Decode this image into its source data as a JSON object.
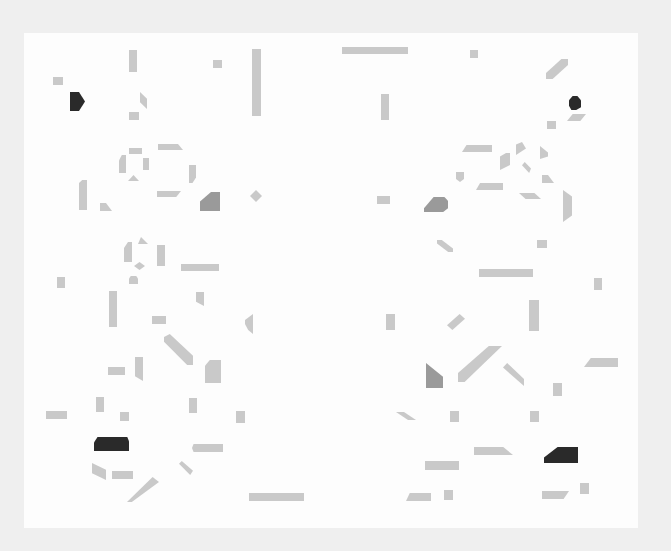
{
  "artwork": {
    "description": "Abstract composition of scattered grey and black geometric fragments on white paper",
    "colors": {
      "light": "#c9c9c9",
      "mid": "#9a9a9a",
      "dark": "#2a2a2a",
      "paper": "#fdfdfd",
      "background": "#efefef"
    },
    "signature": "",
    "shapes": [
      {
        "x": 129,
        "y": 50,
        "w": 8,
        "h": 22,
        "c": "light"
      },
      {
        "x": 213,
        "y": 60,
        "w": 9,
        "h": 8,
        "c": "light"
      },
      {
        "x": 252,
        "y": 49,
        "w": 9,
        "h": 67,
        "c": "light"
      },
      {
        "x": 342,
        "y": 47,
        "w": 66,
        "h": 7,
        "c": "light"
      },
      {
        "x": 470,
        "y": 50,
        "w": 8,
        "h": 8,
        "c": "light"
      },
      {
        "x": 53,
        "y": 77,
        "w": 10,
        "h": 8,
        "c": "light"
      },
      {
        "x": 70,
        "y": 92,
        "w": 15,
        "h": 19,
        "c": "dark",
        "clip": "polygon(0 0,60% 0,100% 50%,60% 100%,0 100%)"
      },
      {
        "x": 140,
        "y": 92,
        "w": 7,
        "h": 17,
        "c": "light",
        "clip": "polygon(0 0,100% 40%,100% 100%,0 60%)"
      },
      {
        "x": 129,
        "y": 112,
        "w": 10,
        "h": 8,
        "c": "light"
      },
      {
        "x": 381,
        "y": 94,
        "w": 8,
        "h": 26,
        "c": "light"
      },
      {
        "x": 546,
        "y": 59,
        "w": 22,
        "h": 20,
        "c": "light",
        "clip": "polygon(70% 0,100% 0,100% 30%,30% 100%,0 100%,0 70%)"
      },
      {
        "x": 569,
        "y": 96,
        "w": 12,
        "h": 14,
        "c": "dark",
        "clip": "polygon(30% 0,70% 0,100% 30%,100% 80%,60% 100%,20% 100%,0 70%,0 30%)"
      },
      {
        "x": 567,
        "y": 114,
        "w": 19,
        "h": 7,
        "c": "light",
        "clip": "polygon(30% 0,100% 0,70% 100%,0 100%)"
      },
      {
        "x": 547,
        "y": 121,
        "w": 9,
        "h": 8,
        "c": "light"
      },
      {
        "x": 129,
        "y": 148,
        "w": 13,
        "h": 6,
        "c": "light"
      },
      {
        "x": 158,
        "y": 144,
        "w": 25,
        "h": 6,
        "c": "light",
        "clip": "polygon(0 0,80% 0,100% 100%,0 100%)"
      },
      {
        "x": 119,
        "y": 155,
        "w": 7,
        "h": 18,
        "c": "light",
        "clip": "polygon(40% 0,100% 0,100% 100%,0 100%,0 30%)"
      },
      {
        "x": 143,
        "y": 158,
        "w": 6,
        "h": 12,
        "c": "light"
      },
      {
        "x": 128,
        "y": 175,
        "w": 11,
        "h": 6,
        "c": "light",
        "clip": "polygon(50% 0,100% 100%,0 100%)"
      },
      {
        "x": 189,
        "y": 165,
        "w": 7,
        "h": 18,
        "c": "light",
        "clip": "polygon(0 0,100% 0,100% 70%,50% 100%,0 100%)"
      },
      {
        "x": 157,
        "y": 191,
        "w": 24,
        "h": 6,
        "c": "light",
        "clip": "polygon(0 0,100% 0,80% 100%,0 100%)"
      },
      {
        "x": 79,
        "y": 180,
        "w": 8,
        "h": 30,
        "c": "light",
        "clip": "polygon(40% 0,100% 0,100% 100%,0 100%,0 10%)"
      },
      {
        "x": 100,
        "y": 203,
        "w": 12,
        "h": 8,
        "c": "light",
        "clip": "polygon(0 0,50% 0,100% 100%,0 100%)"
      },
      {
        "x": 200,
        "y": 192,
        "w": 20,
        "h": 19,
        "c": "mid",
        "clip": "polygon(55% 0,100% 0,100% 100%,0 100%,0 50%)"
      },
      {
        "x": 250,
        "y": 190,
        "w": 12,
        "h": 12,
        "c": "light",
        "clip": "polygon(50% 0,100% 50%,50% 100%,0 50%)"
      },
      {
        "x": 462,
        "y": 145,
        "w": 30,
        "h": 7,
        "c": "light",
        "clip": "polygon(15% 0,100% 0,100% 100%,0 100%)"
      },
      {
        "x": 500,
        "y": 153,
        "w": 10,
        "h": 17,
        "c": "light",
        "clip": "polygon(60% 0,100% 0,100% 70%,0 100%,0 20%)"
      },
      {
        "x": 516,
        "y": 142,
        "w": 10,
        "h": 13,
        "c": "light",
        "clip": "polygon(0 20%,60% 0,100% 50%,0 100%)"
      },
      {
        "x": 540,
        "y": 146,
        "w": 8,
        "h": 13,
        "c": "light",
        "clip": "polygon(0 0,100% 50%,100% 80%,0 100%)"
      },
      {
        "x": 522,
        "y": 162,
        "w": 9,
        "h": 11,
        "c": "light",
        "clip": "polygon(30% 0,100% 60%,80% 100%,0 30%)"
      },
      {
        "x": 456,
        "y": 172,
        "w": 8,
        "h": 10,
        "c": "light",
        "clip": "polygon(0 0,100% 0,100% 70%,50% 100%,0 70%)"
      },
      {
        "x": 476,
        "y": 183,
        "w": 27,
        "h": 7,
        "c": "light",
        "clip": "polygon(15% 0,100% 0,100% 100%,0 100%)"
      },
      {
        "x": 542,
        "y": 175,
        "w": 12,
        "h": 8,
        "c": "light",
        "clip": "polygon(0 0,50% 0,100% 100%,0 100%)"
      },
      {
        "x": 519,
        "y": 193,
        "w": 22,
        "h": 6,
        "c": "light",
        "clip": "polygon(0 0,70% 0,100% 100%,30% 100%)"
      },
      {
        "x": 563,
        "y": 190,
        "w": 9,
        "h": 32,
        "c": "light",
        "clip": "polygon(0 0,100% 20%,100% 80%,0 100%)"
      },
      {
        "x": 377,
        "y": 196,
        "w": 13,
        "h": 8,
        "c": "light"
      },
      {
        "x": 424,
        "y": 197,
        "w": 24,
        "h": 15,
        "c": "mid",
        "clip": "polygon(40% 0,85% 0,100% 25%,100% 75%,80% 100%,0 100%,0 75%)"
      },
      {
        "x": 437,
        "y": 240,
        "w": 16,
        "h": 12,
        "c": "light",
        "clip": "polygon(0 0,30% 0,100% 70%,100% 100%,70% 100%,0 30%)"
      },
      {
        "x": 537,
        "y": 240,
        "w": 10,
        "h": 8,
        "c": "light"
      },
      {
        "x": 479,
        "y": 269,
        "w": 54,
        "h": 8,
        "c": "light"
      },
      {
        "x": 594,
        "y": 278,
        "w": 8,
        "h": 12,
        "c": "light"
      },
      {
        "x": 124,
        "y": 242,
        "w": 8,
        "h": 20,
        "c": "light",
        "clip": "polygon(50% 0,100% 0,100% 100%,0 100%,0 30%)"
      },
      {
        "x": 138,
        "y": 237,
        "w": 10,
        "h": 7,
        "c": "light",
        "clip": "polygon(30% 0,100% 100%,0 100%)"
      },
      {
        "x": 157,
        "y": 245,
        "w": 8,
        "h": 21,
        "c": "light"
      },
      {
        "x": 134,
        "y": 262,
        "w": 11,
        "h": 8,
        "c": "light",
        "clip": "polygon(50% 0,100% 50%,50% 100%,0 50%)"
      },
      {
        "x": 181,
        "y": 264,
        "w": 38,
        "h": 7,
        "c": "light"
      },
      {
        "x": 57,
        "y": 277,
        "w": 8,
        "h": 11,
        "c": "light"
      },
      {
        "x": 129,
        "y": 276,
        "w": 9,
        "h": 8,
        "c": "light",
        "clip": "polygon(20% 0,80% 0,100% 30%,100% 100%,0 100%,0 30%)"
      },
      {
        "x": 109,
        "y": 291,
        "w": 8,
        "h": 36,
        "c": "light"
      },
      {
        "x": 196,
        "y": 292,
        "w": 8,
        "h": 14,
        "c": "light",
        "clip": "polygon(0 0,100% 0,100% 100%,0 70%)"
      },
      {
        "x": 152,
        "y": 316,
        "w": 14,
        "h": 8,
        "c": "light"
      },
      {
        "x": 245,
        "y": 314,
        "w": 8,
        "h": 20,
        "c": "light",
        "clip": "polygon(100% 0,100% 100%,40% 80%,0 50%,0 30%)"
      },
      {
        "x": 164,
        "y": 334,
        "w": 29,
        "h": 31,
        "c": "light",
        "clip": "polygon(0 10%,20% 0,100% 70%,100% 100%,80% 100%,0 25%)"
      },
      {
        "x": 205,
        "y": 360,
        "w": 16,
        "h": 23,
        "c": "light",
        "clip": "polygon(30% 0,100% 0,100% 100%,0 100%,0 25%)"
      },
      {
        "x": 108,
        "y": 367,
        "w": 17,
        "h": 8,
        "c": "light"
      },
      {
        "x": 135,
        "y": 357,
        "w": 8,
        "h": 24,
        "c": "light",
        "clip": "polygon(0 0,100% 0,100% 100%,0 80%)"
      },
      {
        "x": 386,
        "y": 314,
        "w": 9,
        "h": 16,
        "c": "light"
      },
      {
        "x": 447,
        "y": 314,
        "w": 18,
        "h": 16,
        "c": "light",
        "clip": "polygon(70% 0,100% 30%,30% 100%,0 70%)"
      },
      {
        "x": 529,
        "y": 300,
        "w": 10,
        "h": 31,
        "c": "light"
      },
      {
        "x": 426,
        "y": 363,
        "w": 17,
        "h": 25,
        "c": "mid",
        "clip": "polygon(0 0,100% 55%,100% 100%,0 100%)"
      },
      {
        "x": 458,
        "y": 346,
        "w": 44,
        "h": 36,
        "c": "light",
        "clip": "polygon(70% 0,100% 0,15% 100%,0 100%,0 75%)"
      },
      {
        "x": 503,
        "y": 363,
        "w": 21,
        "h": 23,
        "c": "light",
        "clip": "polygon(20% 0,100% 70%,100% 100%,0 20%)"
      },
      {
        "x": 584,
        "y": 358,
        "w": 34,
        "h": 9,
        "c": "light",
        "clip": "polygon(20% 0,100% 0,100% 100%,0 100%)"
      },
      {
        "x": 553,
        "y": 383,
        "w": 9,
        "h": 13,
        "c": "light"
      },
      {
        "x": 96,
        "y": 397,
        "w": 8,
        "h": 15,
        "c": "light"
      },
      {
        "x": 46,
        "y": 411,
        "w": 21,
        "h": 8,
        "c": "light"
      },
      {
        "x": 120,
        "y": 412,
        "w": 9,
        "h": 9,
        "c": "light"
      },
      {
        "x": 189,
        "y": 398,
        "w": 8,
        "h": 15,
        "c": "light"
      },
      {
        "x": 236,
        "y": 411,
        "w": 9,
        "h": 12,
        "c": "light"
      },
      {
        "x": 396,
        "y": 412,
        "w": 20,
        "h": 8,
        "c": "light",
        "clip": "polygon(0 0,40% 0,100% 100%,60% 100%)"
      },
      {
        "x": 450,
        "y": 411,
        "w": 9,
        "h": 11,
        "c": "light"
      },
      {
        "x": 530,
        "y": 411,
        "w": 9,
        "h": 11,
        "c": "light"
      },
      {
        "x": 94,
        "y": 437,
        "w": 35,
        "h": 14,
        "c": "dark",
        "clip": "polygon(10% 0,95% 0,100% 30%,100% 100%,0 100%,0 40%)"
      },
      {
        "x": 192,
        "y": 444,
        "w": 31,
        "h": 8,
        "c": "light",
        "clip": "polygon(5% 0,100% 0,100% 100%,5% 100%,0 50%)"
      },
      {
        "x": 92,
        "y": 463,
        "w": 14,
        "h": 17,
        "c": "light",
        "clip": "polygon(0 0,100% 40%,100% 100%,0 60%)"
      },
      {
        "x": 112,
        "y": 471,
        "w": 21,
        "h": 8,
        "c": "light"
      },
      {
        "x": 179,
        "y": 461,
        "w": 14,
        "h": 14,
        "c": "light",
        "clip": "polygon(0 20%,20% 0,100% 70%,80% 100%)"
      },
      {
        "x": 127,
        "y": 477,
        "w": 32,
        "h": 25,
        "c": "light",
        "clip": "polygon(80% 0,100% 20%,15% 100%,0 100%)"
      },
      {
        "x": 249,
        "y": 493,
        "w": 55,
        "h": 8,
        "c": "light"
      },
      {
        "x": 474,
        "y": 447,
        "w": 39,
        "h": 8,
        "c": "light",
        "clip": "polygon(0 0,75% 0,100% 100%,0 100%)"
      },
      {
        "x": 544,
        "y": 447,
        "w": 34,
        "h": 16,
        "c": "dark",
        "clip": "polygon(40% 0,100% 0,100% 100%,0 100%,0 65%)"
      },
      {
        "x": 425,
        "y": 461,
        "w": 34,
        "h": 9,
        "c": "light"
      },
      {
        "x": 406,
        "y": 493,
        "w": 25,
        "h": 8,
        "c": "light",
        "clip": "polygon(15% 0,100% 0,100% 100%,0 100%)"
      },
      {
        "x": 444,
        "y": 490,
        "w": 9,
        "h": 10,
        "c": "light"
      },
      {
        "x": 542,
        "y": 491,
        "w": 27,
        "h": 8,
        "c": "light",
        "clip": "polygon(0 0,100% 0,80% 100%,0 100%)"
      },
      {
        "x": 580,
        "y": 483,
        "w": 9,
        "h": 11,
        "c": "light"
      }
    ]
  }
}
